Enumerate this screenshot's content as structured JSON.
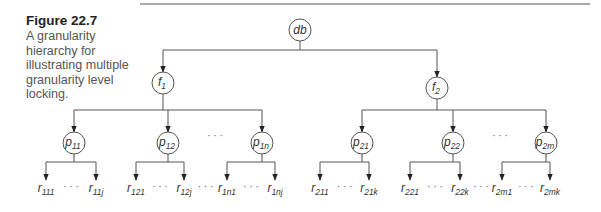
{
  "figure": {
    "title": "Figure 22.7",
    "description": "A granularity hierarchy for illustrating multiple granularity level locking."
  },
  "colors": {
    "line": "#555555",
    "text": "#333333",
    "caption": "#555555"
  },
  "tree": {
    "root": {
      "label": "db",
      "x": 300,
      "y": 30
    },
    "files": [
      {
        "label": "f",
        "sub": "1",
        "x": 163,
        "y": 83
      },
      {
        "label": "f",
        "sub": "2",
        "x": 437,
        "y": 88
      }
    ],
    "pages": [
      {
        "label": "p",
        "sub": "11",
        "x": 74,
        "y": 143,
        "file": 0
      },
      {
        "label": "p",
        "sub": "12",
        "x": 168,
        "y": 143,
        "file": 0
      },
      {
        "label": "p",
        "sub": "1n",
        "x": 262,
        "y": 143,
        "file": 0
      },
      {
        "label": "p",
        "sub": "21",
        "x": 362,
        "y": 143,
        "file": 1
      },
      {
        "label": "p",
        "sub": "22",
        "x": 453,
        "y": 143,
        "file": 1
      },
      {
        "label": "p",
        "sub": "2m",
        "x": 546,
        "y": 143,
        "file": 1
      }
    ],
    "page_ellipses": [
      {
        "text": "· · ·",
        "x": 215,
        "y": 139
      },
      {
        "text": "· · ·",
        "x": 500,
        "y": 139
      }
    ],
    "records": [
      {
        "page": 0,
        "left": {
          "label": "r",
          "sub": "111",
          "x": 46
        },
        "right": {
          "label": "r",
          "sub": "11j",
          "x": 96
        }
      },
      {
        "page": 1,
        "left": {
          "label": "r",
          "sub": "121",
          "x": 136
        },
        "right": {
          "label": "r",
          "sub": "12j",
          "x": 184
        }
      },
      {
        "page": 2,
        "left": {
          "label": "r",
          "sub": "1n1",
          "x": 227
        },
        "right": {
          "label": "r",
          "sub": "1nj",
          "x": 275
        }
      },
      {
        "page": 3,
        "left": {
          "label": "r",
          "sub": "211",
          "x": 320
        },
        "right": {
          "label": "r",
          "sub": "21k",
          "x": 369
        }
      },
      {
        "page": 4,
        "left": {
          "label": "r",
          "sub": "221",
          "x": 410
        },
        "right": {
          "label": "r",
          "sub": "22k",
          "x": 460
        }
      },
      {
        "page": 5,
        "left": {
          "label": "r",
          "sub": "2m1",
          "x": 502
        },
        "right": {
          "label": "r",
          "sub": "2mk",
          "x": 550
        }
      }
    ],
    "record_ellipsis": "· · ·",
    "between_page_ellipsis": "· · ·"
  }
}
